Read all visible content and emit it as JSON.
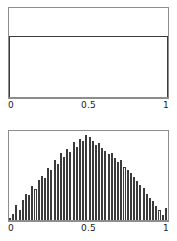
{
  "figure": {
    "background_color": "#ffffff",
    "frame_color": "#8d8d8d",
    "line_color": "#3a3a3a",
    "panel_count": 2
  },
  "panels": [
    {
      "name": "uniform-density-panel",
      "description": "Flat rectangular density of a Uniform(0,1) distribution"
    },
    {
      "name": "triangular-histogram-panel",
      "description": "Histogram with triangular / bell shaped envelope peaking at 0.5"
    }
  ],
  "axes": {
    "uniform": {
      "ticks": [
        "0",
        "0.5",
        "1"
      ],
      "xlim_low": "0",
      "xlim_high": "1"
    },
    "triangular": {
      "ticks": [
        "0",
        "0.5",
        "1"
      ],
      "xlim_low": "0",
      "xlim_high": "1"
    }
  },
  "chart_data": [
    {
      "type": "area",
      "name": "uniform-density",
      "title": "",
      "subtitle": "",
      "xlabel": "",
      "ylabel": "",
      "xlim": [
        0,
        1
      ],
      "ylim": [
        0,
        1.45
      ],
      "xticks": [
        0,
        0.5,
        1
      ],
      "xticklabels": [
        "0",
        "0.5",
        "1"
      ],
      "yticks": [],
      "yticklabels": [],
      "grid": false,
      "legend": false,
      "annotations": [],
      "x": [
        0,
        1
      ],
      "values": [
        1.0,
        1.0
      ],
      "note": "Constant density equal to 1 across the whole support [0,1]; drawn as an open-bottom rectangle."
    },
    {
      "type": "bar",
      "name": "triangular-histogram",
      "title": "",
      "subtitle": "",
      "xlabel": "",
      "ylabel": "",
      "xlim": [
        0,
        1
      ],
      "ylim": [
        0,
        2.0
      ],
      "xticks": [
        0,
        0.5,
        1
      ],
      "xticklabels": [
        "0",
        "0.5",
        "1"
      ],
      "yticks": [],
      "yticklabels": [],
      "grid": false,
      "legend": false,
      "annotations": [],
      "bin_count": 50,
      "bin_width": 0.02,
      "bin_centers": [
        0.01,
        0.03,
        0.05,
        0.07,
        0.09,
        0.11,
        0.13,
        0.15,
        0.17,
        0.19,
        0.21,
        0.23,
        0.25,
        0.27,
        0.29,
        0.31,
        0.33,
        0.35,
        0.37,
        0.39,
        0.41,
        0.43,
        0.45,
        0.47,
        0.49,
        0.51,
        0.53,
        0.55,
        0.57,
        0.59,
        0.61,
        0.63,
        0.65,
        0.67,
        0.69,
        0.71,
        0.73,
        0.75,
        0.77,
        0.79,
        0.81,
        0.83,
        0.85,
        0.87,
        0.89,
        0.91,
        0.93,
        0.95,
        0.97,
        0.99
      ],
      "values": [
        0.02,
        0.07,
        0.17,
        0.12,
        0.24,
        0.31,
        0.29,
        0.4,
        0.36,
        0.47,
        0.52,
        0.49,
        0.61,
        0.58,
        0.7,
        0.66,
        0.78,
        0.74,
        0.83,
        0.8,
        0.91,
        0.86,
        0.95,
        0.93,
        1.0,
        0.97,
        0.92,
        0.88,
        0.9,
        0.84,
        0.81,
        0.77,
        0.79,
        0.72,
        0.68,
        0.7,
        0.62,
        0.58,
        0.55,
        0.5,
        0.46,
        0.41,
        0.38,
        0.3,
        0.26,
        0.22,
        0.16,
        0.12,
        0.06,
        0.14
      ],
      "note": "Counts normalised to the peak bin (=1.00); envelope is triangular, peaking near x = 0.5."
    }
  ]
}
